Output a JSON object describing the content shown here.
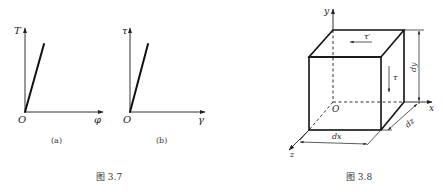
{
  "figure_3_7": {
    "caption": "图 3.7",
    "panel_a": {
      "y_label": "T",
      "x_label": "φ",
      "origin_label": "O",
      "sub_caption": "(a)"
    },
    "panel_b": {
      "y_label": "τ",
      "x_label": "γ",
      "origin_label": "O",
      "sub_caption": "(b)"
    }
  },
  "figure_3_8": {
    "caption": "图 3.8",
    "axes": {
      "x": "x",
      "y": "y",
      "z": "z",
      "origin": "O"
    },
    "stress_labels": {
      "tau_prime": "τ′",
      "tau": "τ"
    },
    "dimensions": {
      "dx": "dx",
      "dy": "dy",
      "dz": "dz"
    }
  }
}
